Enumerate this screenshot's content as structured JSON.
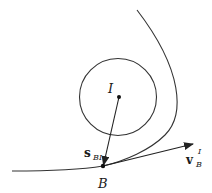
{
  "diagram": {
    "center_label": "I",
    "point_label": "B",
    "vector_s": {
      "base": "s",
      "subscript": "BI"
    },
    "vector_v": {
      "base": "v",
      "superscript": "I",
      "subscript": "B"
    },
    "stroke_color": "#333333"
  }
}
